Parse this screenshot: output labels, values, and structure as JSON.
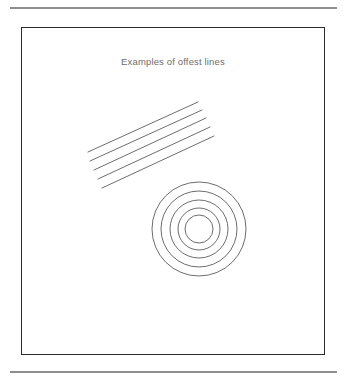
{
  "page": {
    "background_color": "#ffffff",
    "width": 345,
    "height": 378
  },
  "rules": {
    "top_label": "top-horizontal-rule",
    "bottom_label": "bottom-horizontal-rule",
    "color": "#8e8e8e"
  },
  "figure": {
    "title": "Examples of offest lines",
    "title_color": "#6d6d6d",
    "border_color": "#2b2b2b",
    "stroke_color": "#5c5c5c"
  },
  "chart_data": {
    "type": "diagram",
    "title": "Examples of offest lines",
    "xlabel": "",
    "ylabel": "",
    "grid": false,
    "legend": null,
    "coordinate_space": {
      "width": 302,
      "height": 326,
      "note": "coordinates are relative to the inner figure box"
    },
    "groups": [
      {
        "name": "offset-straight-lines",
        "shape": "line",
        "count": 5,
        "description": "Five parallel straight lines offset from each other, running from lower-left to upper-right",
        "lines": [
          {
            "x1": 66,
            "y1": 124,
            "x2": 176,
            "y2": 74
          },
          {
            "x1": 68,
            "y1": 133,
            "x2": 180,
            "y2": 82
          },
          {
            "x1": 72,
            "y1": 142,
            "x2": 184,
            "y2": 90
          },
          {
            "x1": 76,
            "y1": 151,
            "x2": 188,
            "y2": 99
          },
          {
            "x1": 80,
            "y1": 160,
            "x2": 192,
            "y2": 108
          }
        ]
      },
      {
        "name": "offset-concentric-circles",
        "shape": "circle",
        "count": 5,
        "description": "Five concentric circles offset from each other about a common center",
        "center": {
          "cx": 177,
          "cy": 201
        },
        "radii": [
          47,
          38,
          29,
          21,
          14
        ]
      }
    ]
  }
}
